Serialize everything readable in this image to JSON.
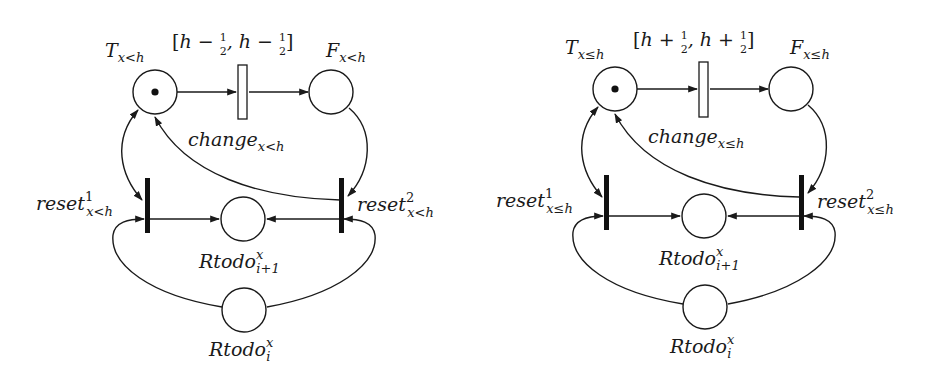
{
  "diagrams": [
    {
      "id": "left",
      "places": {
        "T": {
          "label": "T",
          "sub": "x<h",
          "tokens": 1
        },
        "F": {
          "label": "F",
          "sub": "x<h",
          "tokens": 0
        },
        "Rtodo_next": {
          "label": "Rtodo",
          "sup": "x",
          "sub": "i+1",
          "tokens": 0
        },
        "Rtodo_cur": {
          "label": "Rtodo",
          "sup": "x",
          "sub": "i",
          "tokens": 0
        }
      },
      "transitions": {
        "change": {
          "label": "change",
          "sub": "x<h",
          "interval": "[h − ½, h − ½]",
          "interval_parts": {
            "open": "[h − ",
            "frac1": "1",
            "den1": "2",
            "mid": ", h − ",
            "frac2": "1",
            "den2": "2",
            "close": "]"
          }
        },
        "reset1": {
          "label": "reset",
          "sup": "1",
          "sub": "x<h"
        },
        "reset2": {
          "label": "reset",
          "sup": "2",
          "sub": "x<h"
        }
      }
    },
    {
      "id": "right",
      "places": {
        "T": {
          "label": "T",
          "sub": "x≤h",
          "tokens": 1
        },
        "F": {
          "label": "F",
          "sub": "x≤h",
          "tokens": 0
        },
        "Rtodo_next": {
          "label": "Rtodo",
          "sup": "x",
          "sub": "i+1",
          "tokens": 0
        },
        "Rtodo_cur": {
          "label": "Rtodo",
          "sup": "x",
          "sub": "i",
          "tokens": 0
        }
      },
      "transitions": {
        "change": {
          "label": "change",
          "sub": "x≤h",
          "interval": "[h + ½, h + ½]",
          "interval_parts": {
            "open": "[h + ",
            "frac1": "1",
            "den1": "2",
            "mid": ", h + ",
            "frac2": "1",
            "den2": "2",
            "close": "]"
          }
        },
        "reset1": {
          "label": "reset",
          "sup": "1",
          "sub": "x≤h"
        },
        "reset2": {
          "label": "reset",
          "sup": "2",
          "sub": "x≤h"
        }
      }
    }
  ]
}
